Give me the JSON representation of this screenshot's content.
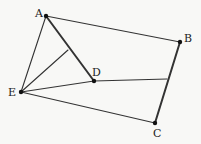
{
  "diagram": {
    "type": "geometry-figure",
    "background": "#f8f8f6",
    "stroke_color": "#333333",
    "points": [
      {
        "id": "A",
        "label": "A",
        "x": 46,
        "y": 16,
        "lx": 35,
        "ly": 17,
        "dot": true
      },
      {
        "id": "B",
        "label": "B",
        "x": 180,
        "y": 42,
        "lx": 184,
        "ly": 42,
        "dot": true
      },
      {
        "id": "C",
        "label": "C",
        "x": 155,
        "y": 123,
        "lx": 153,
        "ly": 137,
        "dot": true
      },
      {
        "id": "D",
        "label": "D",
        "x": 94,
        "y": 81,
        "lx": 92,
        "ly": 76,
        "dot": true
      },
      {
        "id": "E",
        "label": "E",
        "x": 21,
        "y": 92,
        "lx": 8,
        "ly": 96,
        "dot": true
      },
      {
        "id": "M",
        "label": "",
        "x": 68,
        "y": 50,
        "dot": false
      },
      {
        "id": "N",
        "label": "",
        "x": 167,
        "y": 79,
        "dot": false
      }
    ],
    "segments": [
      {
        "from": "A",
        "to": "B",
        "width": 1.1
      },
      {
        "from": "A",
        "to": "E",
        "width": 1.1
      },
      {
        "from": "A",
        "to": "D",
        "width": 2.0
      },
      {
        "from": "E",
        "to": "M",
        "width": 1.1
      },
      {
        "from": "E",
        "to": "D",
        "width": 1.1
      },
      {
        "from": "D",
        "to": "N",
        "width": 1.1
      },
      {
        "from": "E",
        "to": "C",
        "width": 1.1
      },
      {
        "from": "B",
        "to": "C",
        "width": 2.0
      }
    ]
  }
}
